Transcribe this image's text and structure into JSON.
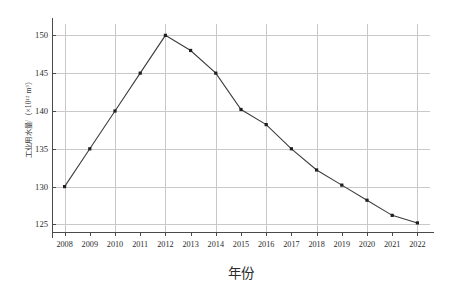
{
  "chart_data": {
    "type": "line",
    "title": "",
    "xlabel": "年份",
    "ylabel": "工业用水量/（×10¹² m³）",
    "categories": [
      "2008",
      "2009",
      "2010",
      "2011",
      "2012",
      "2013",
      "2014",
      "2015",
      "2016",
      "2017",
      "2018",
      "2019",
      "2020",
      "2021",
      "2022"
    ],
    "values": [
      130,
      135,
      140,
      145,
      150,
      148,
      145,
      140.2,
      138.2,
      135,
      132.2,
      130.2,
      128.2,
      126.2,
      125.2
    ],
    "series": [
      {
        "name": "工业用水量",
        "values": [
          130,
          135,
          140,
          145,
          150,
          148,
          145,
          140.2,
          138.2,
          135,
          132.2,
          130.2,
          128.2,
          126.2,
          125.2
        ]
      }
    ],
    "ylim": [
      124,
      151.5
    ],
    "yticks": [
      125,
      130,
      135,
      140,
      145,
      150
    ],
    "ytick_labels": [
      "125",
      "130",
      "135",
      "140",
      "145",
      "150"
    ],
    "xtick_labels": [
      "2008",
      "2009",
      "2010",
      "2011",
      "2012",
      "2013",
      "2014",
      "2015",
      "2016",
      "2017",
      "2018",
      "2019",
      "2020",
      "2021",
      "2022"
    ],
    "grid": true,
    "legend": "none",
    "marker": "square",
    "line_color": "#3d3d3d",
    "marker_color": "#1f1f1f",
    "grid_color": "#c9c9c9",
    "axis_color": "#4a4a4a",
    "background_color": "#ffffff"
  }
}
